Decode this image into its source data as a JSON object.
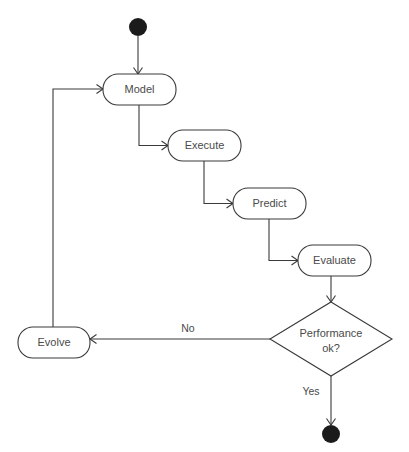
{
  "diagram": {
    "type": "activity-diagram",
    "title": "",
    "canvas": {
      "width": 409,
      "height": 452,
      "background": "#ffffff"
    },
    "colors": {
      "stroke": "#3a3a3a",
      "text": "#4a4a4a",
      "terminal_fill": "#1b1b1b",
      "node_fill": "#ffffff"
    },
    "top_clipped_artifact": ". , . .   .   .    .",
    "nodes": [
      {
        "id": "start",
        "kind": "start-node",
        "label": "",
        "shape": "filled-circle",
        "cx": 138,
        "cy": 27,
        "r": 9
      },
      {
        "id": "model",
        "kind": "action-node",
        "label": "Model",
        "shape": "rounded-rect",
        "x": 103,
        "y": 74,
        "w": 73,
        "h": 31,
        "rx": 15
      },
      {
        "id": "execute",
        "kind": "action-node",
        "label": "Execute",
        "shape": "rounded-rect",
        "x": 168,
        "y": 130,
        "w": 73,
        "h": 31,
        "rx": 15
      },
      {
        "id": "predict",
        "kind": "action-node",
        "label": "Predict",
        "shape": "rounded-rect",
        "x": 233,
        "y": 188,
        "w": 73,
        "h": 31,
        "rx": 15
      },
      {
        "id": "evaluate",
        "kind": "action-node",
        "label": "Evaluate",
        "shape": "rounded-rect",
        "x": 298,
        "y": 245,
        "w": 73,
        "h": 31,
        "rx": 15
      },
      {
        "id": "decision",
        "kind": "decision-node",
        "label_line1": "Performance",
        "label_line2": "ok?",
        "shape": "diamond",
        "cx": 331,
        "cy": 339,
        "rx": 61,
        "ry": 37
      },
      {
        "id": "evolve",
        "kind": "action-node",
        "label": "Evolve",
        "shape": "rounded-rect",
        "x": 18,
        "y": 327,
        "w": 72,
        "h": 31,
        "rx": 15
      },
      {
        "id": "end",
        "kind": "end-node",
        "label": "",
        "shape": "filled-circle",
        "cx": 331,
        "cy": 434,
        "r": 9
      }
    ],
    "edges": [
      {
        "id": "start-to-model",
        "from": "start",
        "to": "model",
        "label": "",
        "path": "M 138 36 L 138 74",
        "arrow": "M 133.5 67.5 L 138 74 L 142.5 67.5"
      },
      {
        "id": "model-to-execute",
        "from": "model",
        "to": "execute",
        "label": "",
        "path": "M 139 105 L 139 145.5 L 168 145.5",
        "arrow": "M 161.5 141 L 168 145.5 L 161.5 150"
      },
      {
        "id": "execute-to-predict",
        "from": "execute",
        "to": "predict",
        "label": "",
        "path": "M 204 161 L 204 203.5 L 233 203.5",
        "arrow": "M 226.5 199 L 233 203.5 L 226.5 208"
      },
      {
        "id": "predict-to-evaluate",
        "from": "predict",
        "to": "evaluate",
        "label": "",
        "path": "M 269 219 L 269 260.5 L 298 260.5",
        "arrow": "M 291.5 256 L 298 260.5 L 291.5 265"
      },
      {
        "id": "evaluate-to-decision",
        "from": "evaluate",
        "to": "decision",
        "label": "",
        "path": "M 331 276 L 331 302",
        "arrow": "M 326.5 295.5 L 331 302 L 335.5 295.5"
      },
      {
        "id": "decision-to-evolve",
        "from": "decision",
        "to": "evolve",
        "label": "No",
        "label_x": 188,
        "label_y": 329,
        "path": "M 270 339 L 90 339",
        "arrow": "M 96.5 334.5 L 90 339 L 96.5 343.5"
      },
      {
        "id": "evolve-to-model",
        "from": "evolve",
        "to": "model",
        "label": "",
        "path": "M 53 327 L 53 89 L 103 89",
        "arrow": "M 96.5 84.5 L 103 89 L 96.5 93.5"
      },
      {
        "id": "decision-to-end",
        "from": "decision",
        "to": "end",
        "label": "Yes",
        "label_x": 311,
        "label_y": 392,
        "path": "M 331 376 L 331 425",
        "arrow": "M 326.5 418.5 L 331 425 L 335.5 418.5"
      }
    ]
  }
}
